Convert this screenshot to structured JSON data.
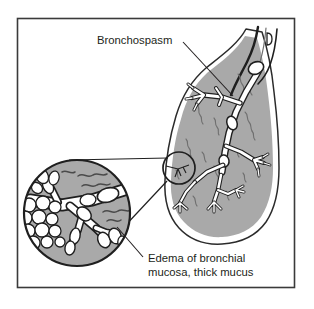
{
  "figure": {
    "name": "asthma-bronchospasm-illustration",
    "background_color": "#ffffff",
    "frame": {
      "name": "illustration-border",
      "color": "#3a3a3a",
      "x": 17,
      "y": 18,
      "width": 278,
      "height": 270
    }
  },
  "colors": {
    "lung_fill": "#a9a9a9",
    "lung_outline": "#2b2b2b",
    "lung_inner_band": "#ffffff",
    "airway_fill": "#ffffff",
    "airway_outline": "#1f1f1f",
    "vessel_gray": "#6f6f6f",
    "mucus_strand": "#4a4a4a",
    "inset_fill": "#a9a9a9",
    "inset_outline": "#1f1f1f",
    "mucus_bubble_fill": "#ffffff",
    "text": "#231f20",
    "leader_line": "#231f20"
  },
  "labels": [
    {
      "name": "bronchospasm-label",
      "text": "Bronchospasm",
      "x": 97,
      "y": 40,
      "lines": [
        "Bronchospasm"
      ],
      "leader": {
        "x1": 183,
        "y1": 42,
        "x2": 233,
        "y2": 96
      }
    },
    {
      "name": "edema-label",
      "text": "Edema of bronchial mucosa, thick mucus",
      "x": 148,
      "y": 262,
      "lines": [
        "Edema of bronchial",
        "mucosa, thick mucus"
      ],
      "leader": {
        "x1": 143,
        "y1": 257,
        "x2": 117,
        "y2": 227
      }
    }
  ],
  "anatomy": {
    "lung": {
      "name": "lung-silhouette",
      "description": "Right lung seen in coronal section, gray fill with white inner band"
    },
    "trachea": {
      "name": "trachea-stub",
      "description": "Cut trachea and main bronchus entering the lung from upper right"
    },
    "bronchial_tree": {
      "name": "bronchial-tree",
      "description": "White branching airways with constricted (bronchospasm) segments"
    },
    "callout_circle": {
      "name": "callout-source-circle",
      "cx": 179,
      "cy": 168,
      "r": 16,
      "description": "Small circle marking the magnified bronchiole"
    },
    "inset": {
      "name": "magnified-inset-circle",
      "cx": 77,
      "cy": 213,
      "r": 54,
      "description": "Magnified view showing swollen mucosa, narrowed lumen and mucus plugs"
    },
    "mucus_bubbles": {
      "name": "mucus-bubble-cluster",
      "count": 13,
      "description": "White round mucus globules clustered at lower left of inset"
    },
    "mucus_strands": {
      "name": "mucus-strands",
      "description": "Dark wavy strands representing thick mucus"
    }
  }
}
